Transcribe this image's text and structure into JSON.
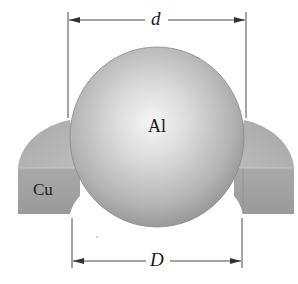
{
  "figure": {
    "sphere_label": "Al",
    "ring_label": "Cu",
    "top_dimension_label": "d",
    "bottom_dimension_label": "D"
  },
  "colors": {
    "background": "#ffffff",
    "sphere_highlight": "#f4f4f4",
    "sphere_mid": "#c8c8c8",
    "sphere_edge": "#8e8e8e",
    "ring_top": "#b4b4b4",
    "ring_face": "#9e9e9e",
    "dimension_line": "#4a4a4a",
    "text": "#1a1a1a"
  }
}
